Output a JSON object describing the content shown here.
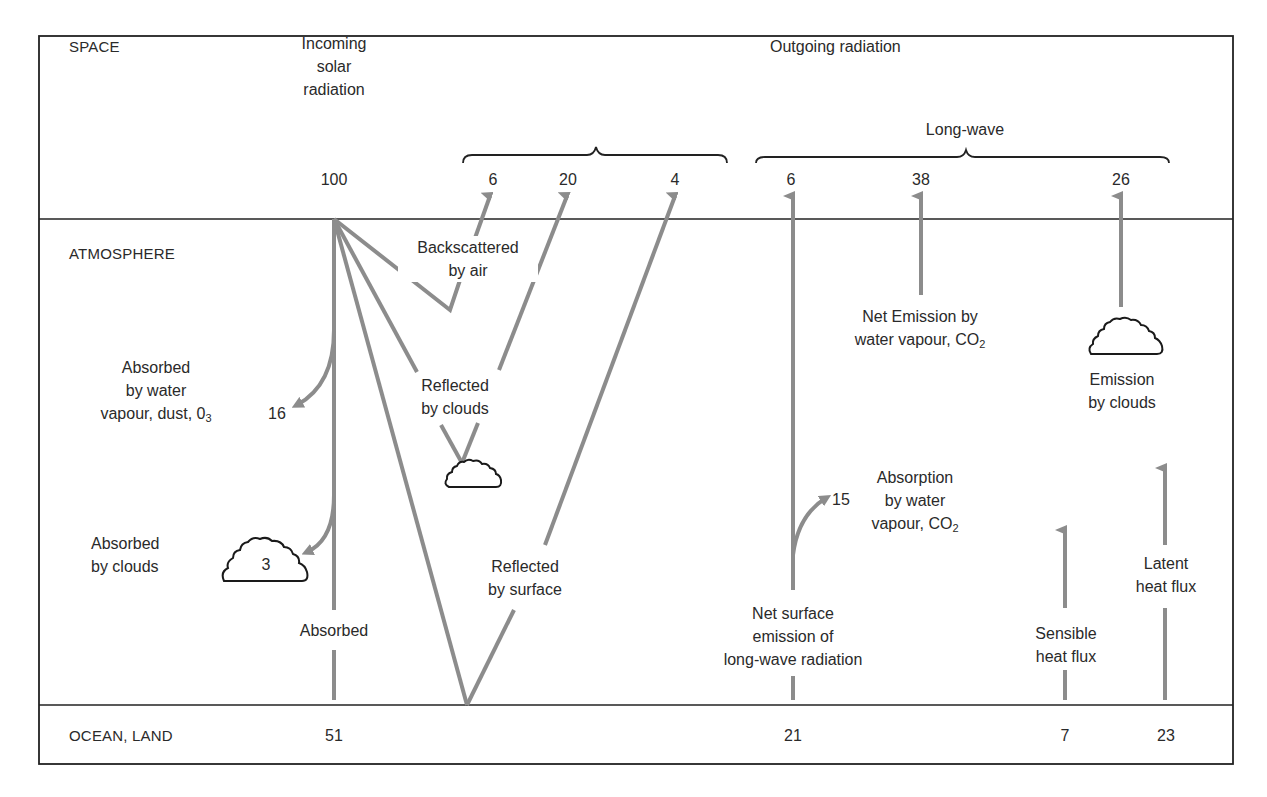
{
  "sections": {
    "space": "SPACE",
    "atmosphere": "ATMOSPHERE",
    "surface": "OCEAN, LAND"
  },
  "headers": {
    "incoming": [
      "Incoming",
      "solar",
      "radiation"
    ],
    "outgoing": "Outgoing radiation",
    "longwave": "Long-wave"
  },
  "space_values": {
    "incoming": "100",
    "backscattered_air": "6",
    "reflected_clouds": "20",
    "reflected_surface": "4",
    "surface_longwave": "6",
    "net_emission_vapour": "38",
    "emission_clouds": "26"
  },
  "atmosphere_labels": {
    "backscattered": [
      "Backscattered",
      "by air"
    ],
    "absorbed_vapour": [
      "Absorbed",
      "by water",
      "vapour, dust, 0",
      "3"
    ],
    "absorbed_vapour_value": "16",
    "reflected_clouds": [
      "Reflected",
      "by clouds"
    ],
    "absorbed_clouds": [
      "Absorbed",
      "by clouds"
    ],
    "absorbed_clouds_value": "3",
    "absorbed": "Absorbed",
    "reflected_surface": [
      "Reflected",
      "by surface"
    ],
    "net_emission": [
      "Net Emission by",
      "water vapour, CO",
      "2"
    ],
    "emission_clouds": [
      "Emission",
      "by clouds"
    ],
    "absorption_vapour": [
      "Absorption",
      "by water",
      "vapour, CO",
      "2"
    ],
    "absorption_vapour_value": "15",
    "net_surface": [
      "Net surface",
      "emission of",
      "long-wave radiation"
    ],
    "sensible": [
      "Sensible",
      "heat flux"
    ],
    "latent": [
      "Latent",
      "heat flux"
    ]
  },
  "surface_values": {
    "absorbed": "51",
    "net_longwave": "21",
    "sensible": "7",
    "latent": "23"
  },
  "colors": {
    "arrow": "#8c8c8c",
    "border": "#222222",
    "text": "#2a2a2a"
  }
}
